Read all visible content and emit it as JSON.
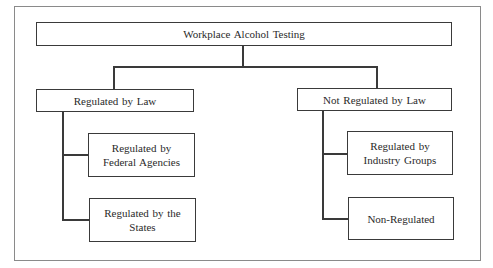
{
  "diagram": {
    "type": "hierarchy",
    "root": {
      "label": "Workplace Alcohol Testing"
    },
    "branches": [
      {
        "label": "Regulated by Law",
        "children": [
          {
            "label": "Regulated by\nFederal Agencies"
          },
          {
            "label": "Regulated by the\nStates"
          }
        ]
      },
      {
        "label": "Not Regulated by Law",
        "children": [
          {
            "label": "Regulated by\nIndustry Groups"
          },
          {
            "label": "Non-Regulated"
          }
        ]
      }
    ],
    "colors": {
      "line": "#3a3a3a",
      "frame": "#8a8a8a",
      "background": "#ffffff",
      "text": "#2a2a2a"
    }
  }
}
